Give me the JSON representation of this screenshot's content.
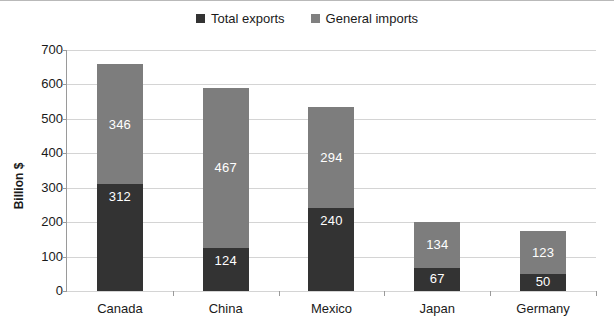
{
  "chart_data": {
    "type": "bar",
    "subtype": "stacked-vertical",
    "title": "",
    "xlabel": "",
    "ylabel": "Billion $",
    "ylim": [
      0,
      700
    ],
    "ytick_step": 100,
    "yticks": [
      700,
      600,
      500,
      400,
      300,
      200,
      100,
      0
    ],
    "ytick_labels": [
      "700",
      "600",
      "500",
      "400",
      "300",
      "200",
      "100",
      "0"
    ],
    "grid": true,
    "legend_position": "top-center",
    "categories": [
      "Canada",
      "China",
      "Mexico",
      "Japan",
      "Germany"
    ],
    "series": [
      {
        "name": "Total exports",
        "color": "#333333",
        "values": [
          312,
          124,
          240,
          67,
          50
        ],
        "labels": [
          "312",
          "124",
          "240",
          "67",
          "50"
        ]
      },
      {
        "name": "General imports",
        "color": "#7d7d7d",
        "values": [
          346,
          467,
          294,
          134,
          123
        ],
        "labels": [
          "346",
          "467",
          "294",
          "134",
          "123"
        ]
      }
    ],
    "totals": [
      658,
      591,
      534,
      201,
      173
    ]
  },
  "legend": {
    "items": [
      {
        "label": "Total exports",
        "color": "#333333"
      },
      {
        "label": "General imports",
        "color": "#7d7d7d"
      }
    ]
  },
  "axis": {
    "y_title": "Billion $"
  }
}
